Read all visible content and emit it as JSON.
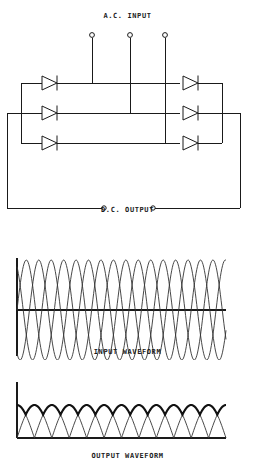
{
  "figure": {
    "title_ac": "A.C. INPUT",
    "title_dc": "D.C. OUTPUT",
    "label_input_waveform": "INPUT WAVEFORM",
    "label_output_waveform": "OUTPUT WAVEFORM",
    "line_color": "#1a1a1a",
    "background": "#ffffff"
  },
  "circuit": {
    "type": "three-phase-full-wave-bridge-rectifier",
    "ac_terminals": 3,
    "dc_terminals": 2,
    "diode_count": 6,
    "left_bank_diodes": 3,
    "right_bank_diodes": 3,
    "diode_direction": "right"
  },
  "chart_data": [
    {
      "type": "line",
      "title": "INPUT WAVEFORM",
      "xlabel": "",
      "ylabel": "",
      "grid": false,
      "legend": "none",
      "xlim": [
        0,
        6
      ],
      "ylim": [
        -1,
        1
      ],
      "x_axis_position": "center",
      "series": [
        {
          "name": "Phase A",
          "phase_deg": 0,
          "amplitude": 1,
          "cycles": 5.6
        },
        {
          "name": "Phase B",
          "phase_deg": 120,
          "amplitude": 1,
          "cycles": 5.6
        },
        {
          "name": "Phase C",
          "phase_deg": 240,
          "amplitude": 1,
          "cycles": 5.6
        }
      ]
    },
    {
      "type": "line",
      "title": "OUTPUT WAVEFORM",
      "xlabel": "",
      "ylabel": "",
      "grid": false,
      "legend": "none",
      "xlim": [
        0,
        6
      ],
      "ylim": [
        0,
        1
      ],
      "x_axis_position": "bottom",
      "series": [
        {
          "name": "Rectified ripple",
          "pulses": 12,
          "amplitude": 1,
          "ripple": "six-pulse"
        },
        {
          "name": "DC envelope",
          "amplitude": 1,
          "emphasis": "bold"
        }
      ]
    }
  ]
}
